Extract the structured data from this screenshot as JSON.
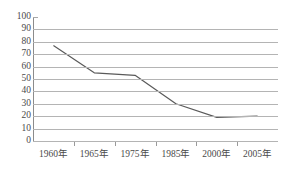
{
  "top_clipped_text": "",
  "chart_data": {
    "type": "line",
    "title": "",
    "xlabel": "",
    "ylabel": "",
    "categories": [
      "1960年",
      "1965年",
      "1975年",
      "1985年",
      "2000年",
      "2005年"
    ],
    "values": [
      77,
      55,
      53,
      30,
      19,
      20
    ],
    "series": [
      {
        "name": "",
        "values": [
          77,
          55,
          53,
          30,
          19,
          20
        ]
      }
    ],
    "ylim": [
      0,
      100
    ],
    "ytick_step": 10,
    "yticks": [
      100,
      90,
      80,
      70,
      60,
      50,
      40,
      30,
      20,
      10,
      0
    ],
    "grid": true,
    "legend": false,
    "legend_position": "none",
    "line_color": "#5a5a5a",
    "grid_color": "#b4b4b4",
    "axis_color": "#8c8c8c",
    "markers": false
  }
}
